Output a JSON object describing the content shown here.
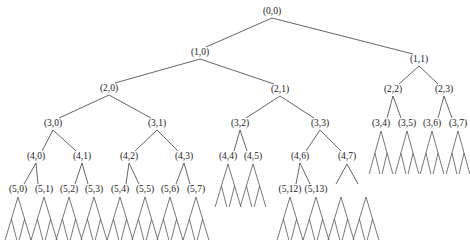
{
  "diagram": {
    "type": "binary-tree",
    "line_color": "#555555",
    "text_color": "#222222",
    "nodes": [
      {
        "id": "0_0",
        "label": "(0,0)",
        "x": 272,
        "y": 12,
        "parent": null
      },
      {
        "id": "1_0",
        "label": "(1,0)",
        "x": 200,
        "y": 53,
        "parent": "0_0"
      },
      {
        "id": "1_1",
        "label": "(1,1)",
        "x": 419,
        "y": 60,
        "parent": "0_0"
      },
      {
        "id": "2_0",
        "label": "(2,0)",
        "x": 109,
        "y": 89,
        "parent": "1_0"
      },
      {
        "id": "2_1",
        "label": "(2,1)",
        "x": 280,
        "y": 90,
        "parent": "1_0"
      },
      {
        "id": "2_2",
        "label": "(2,2)",
        "x": 393,
        "y": 90,
        "parent": "1_1"
      },
      {
        "id": "2_3",
        "label": "(2,3)",
        "x": 444,
        "y": 90,
        "parent": "1_1"
      },
      {
        "id": "3_0",
        "label": "(3,0)",
        "x": 53,
        "y": 124,
        "parent": "2_0"
      },
      {
        "id": "3_1",
        "label": "(3,1)",
        "x": 157,
        "y": 124,
        "parent": "2_0"
      },
      {
        "id": "3_2",
        "label": "(3,2)",
        "x": 240,
        "y": 124,
        "parent": "2_1"
      },
      {
        "id": "3_3",
        "label": "(3,3)",
        "x": 320,
        "y": 124,
        "parent": "2_1"
      },
      {
        "id": "3_4",
        "label": "(3,4)",
        "x": 381,
        "y": 124,
        "parent": "2_2"
      },
      {
        "id": "3_5",
        "label": "(3,5)",
        "x": 407,
        "y": 124,
        "parent": "2_2"
      },
      {
        "id": "3_6",
        "label": "(3,6)",
        "x": 432,
        "y": 124,
        "parent": "2_3"
      },
      {
        "id": "3_7",
        "label": "(3,7)",
        "x": 458,
        "y": 124,
        "parent": "2_3"
      },
      {
        "id": "4_0",
        "label": "(4,0)",
        "x": 36,
        "y": 157,
        "parent": "3_0"
      },
      {
        "id": "4_1",
        "label": "(4,1)",
        "x": 82,
        "y": 157,
        "parent": "3_0"
      },
      {
        "id": "4_2",
        "label": "(4,2)",
        "x": 129,
        "y": 157,
        "parent": "3_1"
      },
      {
        "id": "4_3",
        "label": "(4,3)",
        "x": 184,
        "y": 157,
        "parent": "3_1"
      },
      {
        "id": "4_4",
        "label": "(4,4)",
        "x": 228,
        "y": 157,
        "parent": "3_2"
      },
      {
        "id": "4_5",
        "label": "(4,5)",
        "x": 253,
        "y": 157,
        "parent": "3_2"
      },
      {
        "id": "4_6",
        "label": "(4,6)",
        "x": 300,
        "y": 157,
        "parent": "3_3"
      },
      {
        "id": "4_7",
        "label": "(4,7)",
        "x": 347,
        "y": 157,
        "parent": "3_3"
      },
      {
        "id": "5_0",
        "label": "(5,0)",
        "x": 18,
        "y": 190,
        "parent": "4_0"
      },
      {
        "id": "5_1",
        "label": "(5,1)",
        "x": 44,
        "y": 190,
        "parent": "4_0"
      },
      {
        "id": "5_2",
        "label": "(5,2)",
        "x": 69,
        "y": 190,
        "parent": "4_1"
      },
      {
        "id": "5_3",
        "label": "(5,3)",
        "x": 94,
        "y": 190,
        "parent": "4_1"
      },
      {
        "id": "5_4",
        "label": "(5,4)",
        "x": 120,
        "y": 190,
        "parent": "4_2"
      },
      {
        "id": "5_5",
        "label": "(5,5)",
        "x": 145,
        "y": 190,
        "parent": "4_2"
      },
      {
        "id": "5_6",
        "label": "(5,6)",
        "x": 170,
        "y": 190,
        "parent": "4_3"
      },
      {
        "id": "5_7",
        "label": "(5,7)",
        "x": 196,
        "y": 190,
        "parent": "4_3"
      },
      {
        "id": "5_12",
        "label": "(5,12)",
        "x": 290,
        "y": 190,
        "parent": "4_6"
      },
      {
        "id": "5_13",
        "label": "(5,13)",
        "x": 316,
        "y": 190,
        "parent": "4_6"
      }
    ],
    "unlabeled_branches": [
      {
        "parent": "4_7",
        "left_x": 336,
        "right_x": 358,
        "y_top": 164,
        "y_bottom": 184
      }
    ],
    "subtrees": {
      "note": "Unlabeled two-level binary fans (apex splits into 2, each splits into 2)",
      "level5_fans": {
        "apex_y": 197,
        "mid_y": 219,
        "base_y": 240,
        "half_width": 12,
        "parents": [
          "5_0",
          "5_1",
          "5_2",
          "5_3",
          "5_4",
          "5_5",
          "5_6",
          "5_7",
          "5_12",
          "5_13"
        ]
      },
      "extra_fans_under_4_7": {
        "apex_y": 197,
        "mid_y": 219,
        "base_y": 240,
        "half_width": 12,
        "xs": [
          341,
          366
        ]
      },
      "level4_fans": {
        "apex_y": 164,
        "mid_y": 186,
        "base_y": 207,
        "half_width": 12,
        "parents": [
          "4_4",
          "4_5"
        ]
      },
      "level3_fans": {
        "apex_y": 131,
        "mid_y": 153,
        "base_y": 174,
        "half_width": 11,
        "parents": [
          "3_4",
          "3_5",
          "3_6",
          "3_7"
        ]
      }
    }
  }
}
